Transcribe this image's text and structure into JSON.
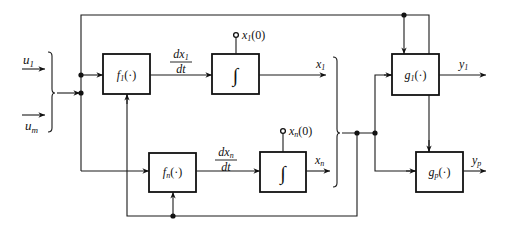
{
  "diagram": {
    "colors": {
      "line": "#1a1a1a",
      "background": "#ffffff"
    },
    "inputs": [
      {
        "id": "u1",
        "label": "u",
        "sub": "1"
      },
      {
        "id": "um",
        "label": "u",
        "sub": "m"
      }
    ],
    "blocks": {
      "f1": {
        "label": "f",
        "sub": "1",
        "arg": "(·)"
      },
      "fn": {
        "label": "f",
        "sub": "n",
        "arg": "(·)"
      },
      "int1": {
        "symbol": "∫"
      },
      "intn": {
        "symbol": "∫"
      },
      "g1": {
        "label": "g",
        "sub": "1",
        "arg": "(·)"
      },
      "gp": {
        "label": "g",
        "sub": "p",
        "arg": "(·)"
      }
    },
    "signals": {
      "dx1_num": "dx",
      "dx1_sub": "1",
      "dx1_den": "dt",
      "dxn_num": "dx",
      "dxn_sub": "n",
      "dxn_den": "dt",
      "x1": "x",
      "x1_sub": "1",
      "xn": "x",
      "xn_sub": "n",
      "x10": "x",
      "x10_sub": "1",
      "x10_arg": "(0)",
      "xn0": "x",
      "xn0_sub": "n",
      "xn0_arg": "(0)"
    },
    "outputs": [
      {
        "id": "y1",
        "label": "y",
        "sub": "1"
      },
      {
        "id": "yp",
        "label": "y",
        "sub": "p"
      }
    ]
  }
}
